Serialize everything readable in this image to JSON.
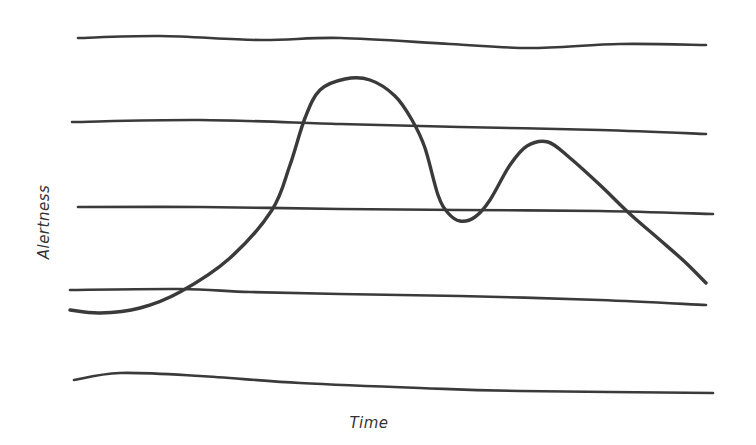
{
  "chart_data": {
    "type": "line",
    "title": "",
    "xlabel": "Time",
    "ylabel": "Alertness",
    "style": "hand-drawn sketch",
    "grid": true,
    "legend": null,
    "colors": {
      "stroke": "#3a3a3a",
      "background": "#ffffff"
    },
    "gridlines_px": [
      [
        [
          78,
          38
        ],
        [
          160,
          36
        ],
        [
          260,
          40
        ],
        [
          340,
          38
        ],
        [
          450,
          44
        ],
        [
          530,
          48
        ],
        [
          620,
          44
        ],
        [
          706,
          45
        ]
      ],
      [
        [
          72,
          122
        ],
        [
          200,
          120
        ],
        [
          340,
          124
        ],
        [
          460,
          127
        ],
        [
          600,
          130
        ],
        [
          706,
          134
        ]
      ],
      [
        [
          78,
          207
        ],
        [
          200,
          207
        ],
        [
          340,
          209
        ],
        [
          460,
          210
        ],
        [
          600,
          211
        ],
        [
          713,
          214
        ]
      ],
      [
        [
          70,
          290
        ],
        [
          180,
          289
        ],
        [
          250,
          292
        ],
        [
          340,
          294
        ],
        [
          460,
          296
        ],
        [
          600,
          300
        ],
        [
          706,
          305
        ]
      ],
      [
        [
          74,
          380
        ],
        [
          120,
          373
        ],
        [
          200,
          376
        ],
        [
          300,
          383
        ],
        [
          420,
          388
        ],
        [
          520,
          391
        ],
        [
          713,
          393
        ]
      ]
    ],
    "series": [
      {
        "name": "Alertness",
        "points_px": [
          [
            70,
            310
          ],
          [
            100,
            313
          ],
          [
            140,
            308
          ],
          [
            180,
            292
          ],
          [
            230,
            258
          ],
          [
            272,
            210
          ],
          [
            290,
            165
          ],
          [
            305,
            118
          ],
          [
            320,
            90
          ],
          [
            345,
            79
          ],
          [
            370,
            80
          ],
          [
            395,
            96
          ],
          [
            412,
            120
          ],
          [
            425,
            148
          ],
          [
            438,
            195
          ],
          [
            448,
            213
          ],
          [
            460,
            221
          ],
          [
            475,
            217
          ],
          [
            490,
            200
          ],
          [
            510,
            165
          ],
          [
            527,
            146
          ],
          [
            548,
            142
          ],
          [
            570,
            158
          ],
          [
            600,
            185
          ],
          [
            630,
            214
          ],
          [
            660,
            240
          ],
          [
            685,
            262
          ],
          [
            706,
            283
          ]
        ],
        "x_rel": [
          0,
          0.05,
          0.11,
          0.17,
          0.25,
          0.31,
          0.34,
          0.37,
          0.39,
          0.43,
          0.47,
          0.51,
          0.54,
          0.56,
          0.58,
          0.59,
          0.61,
          0.63,
          0.66,
          0.69,
          0.71,
          0.75,
          0.78,
          0.83,
          0.88,
          0.93,
          0.97,
          1.0
        ],
        "y_rel": [
          0.28,
          0.27,
          0.29,
          0.34,
          0.45,
          0.6,
          0.74,
          0.88,
          0.97,
          1.0,
          1.0,
          0.95,
          0.87,
          0.79,
          0.64,
          0.58,
          0.56,
          0.57,
          0.62,
          0.73,
          0.79,
          0.81,
          0.76,
          0.67,
          0.58,
          0.5,
          0.43,
          0.37
        ]
      }
    ],
    "annotations": [
      "Primary peak of alertness around 40% of the timeline",
      "Dip around 60% of the timeline",
      "Secondary smaller peak around 72% of the timeline",
      "Decline toward the end"
    ],
    "ylim": [
      0,
      1
    ],
    "xlim": [
      0,
      1
    ]
  },
  "labels": {
    "x_axis": "Time",
    "y_axis": "Alertness"
  }
}
